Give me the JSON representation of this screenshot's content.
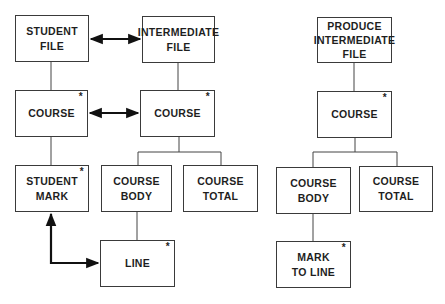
{
  "diagram": {
    "type": "jackson-structure-diagram",
    "left_structure": {
      "boxes": {
        "student_file": {
          "label": "STUDENT\nFILE",
          "iterated": false
        },
        "intermediate_file": {
          "label": "INTERMEDIATE\nFILE",
          "iterated": false
        },
        "course_left": {
          "label": "COURSE",
          "iterated": true,
          "marker": "*"
        },
        "course_mid": {
          "label": "COURSE",
          "iterated": true,
          "marker": "*"
        },
        "student_mark": {
          "label": "STUDENT\nMARK",
          "iterated": true,
          "marker": "*"
        },
        "course_body_mid": {
          "label": "COURSE\nBODY",
          "iterated": false
        },
        "course_total_mid": {
          "label": "COURSE\nTOTAL",
          "iterated": false
        },
        "line": {
          "label": "LINE",
          "iterated": true,
          "marker": "*"
        }
      },
      "correspondences": [
        {
          "from": "STUDENT FILE",
          "to": "INTERMEDIATE FILE",
          "style": "double-arrow"
        },
        {
          "from": "COURSE",
          "to": "COURSE",
          "style": "double-arrow"
        },
        {
          "from": "STUDENT MARK",
          "to": "LINE",
          "style": "double-arrow-elbow"
        }
      ]
    },
    "right_structure": {
      "boxes": {
        "produce_intermediate_file": {
          "label": "PRODUCE\nINTERMEDIATE\nFILE",
          "iterated": false
        },
        "course_right": {
          "label": "COURSE",
          "iterated": true,
          "marker": "*"
        },
        "course_body_right": {
          "label": "COURSE\nBODY",
          "iterated": false
        },
        "course_total_right": {
          "label": "COURSE\nTOTAL",
          "iterated": false
        },
        "mark_to_line": {
          "label": "MARK\nTO LINE",
          "iterated": true,
          "marker": "*"
        }
      }
    }
  }
}
